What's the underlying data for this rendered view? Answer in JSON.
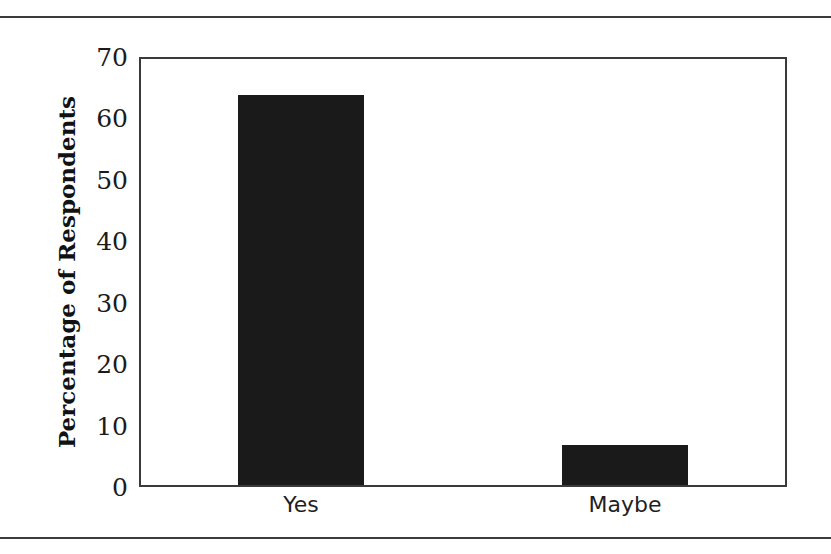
{
  "chart_data": {
    "type": "bar",
    "title": "",
    "subtitle": "",
    "xlabel": "",
    "ylabel": "Percentage of Respondents",
    "categories": [
      "Yes",
      "Maybe"
    ],
    "values": [
      63.5,
      6.5
    ],
    "series": [
      {
        "name": "Percentage of Respondents",
        "values": [
          63.5,
          6.5
        ]
      }
    ],
    "ylim": [
      0,
      70
    ],
    "yticks": [
      0,
      10,
      20,
      30,
      40,
      50,
      60,
      70
    ],
    "ytick_labels": [
      "0",
      "10",
      "20",
      "30",
      "40",
      "50",
      "60",
      "70"
    ],
    "grid": false,
    "legend": false,
    "legend_position": "none",
    "bar_color": "#1a1a1a",
    "axis_color": "#3a3a3a",
    "background_color": "#ffffff",
    "annotations": []
  },
  "figure": {
    "top_rule": "horizontal-rule",
    "bottom_rule": "horizontal-rule"
  }
}
